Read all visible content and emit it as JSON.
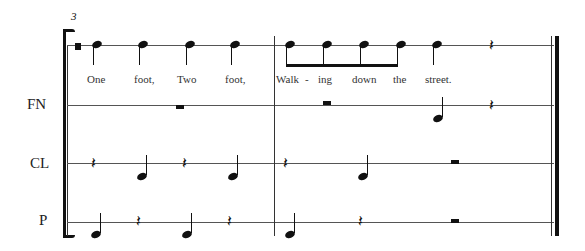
{
  "score": {
    "measure_number": "3",
    "staves": [
      {
        "id": "voice",
        "label": ""
      },
      {
        "id": "fn",
        "label": "FN"
      },
      {
        "id": "cl",
        "label": "CL"
      },
      {
        "id": "p",
        "label": "P"
      }
    ],
    "lyrics": [
      "One",
      "foot,",
      "Two",
      "foot,",
      "Walk",
      "-",
      "ing",
      "down",
      "the",
      "street."
    ],
    "rest_glyph": "𝄽"
  }
}
